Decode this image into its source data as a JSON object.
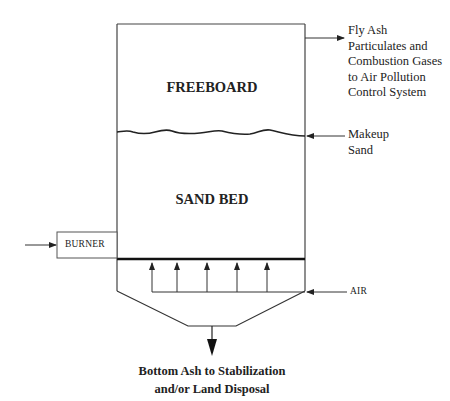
{
  "diagram": {
    "type": "process-schematic",
    "zones": {
      "freeboard": "FREEBOARD",
      "sand_bed": "SAND BED"
    },
    "components": {
      "burner": "BURNER"
    },
    "inputs": {
      "air": "AIR",
      "makeup_sand": [
        "Makeup",
        "Sand"
      ]
    },
    "outputs": {
      "fly_ash": [
        "Fly  Ash",
        "Particulates and",
        "Combustion Gases",
        "to  Air Pollution",
        "Control  System"
      ],
      "bottom_ash": [
        "Bottom Ash to Stabilization",
        "and/or Land Disposal"
      ]
    },
    "air_distributor_arrows": 5,
    "colors": {
      "line": "#333333",
      "background": "#ffffff"
    }
  }
}
